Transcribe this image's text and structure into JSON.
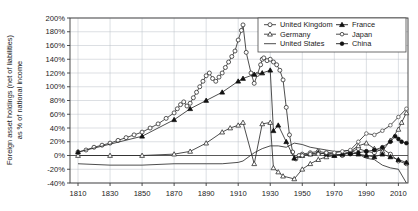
{
  "chart_data": {
    "type": "line",
    "title": "",
    "xlabel": "",
    "ylabel": "Foreign asset holdings (net of liabilities) as % of national income",
    "ylabel_line1": "Foreign asset holdings (net of liabilities)",
    "ylabel_line2": "as % of national income",
    "xlim": [
      1805,
      2016
    ],
    "ylim": [
      -40,
      200
    ],
    "ytick_step": 20,
    "xtick_step": 20,
    "grid": true,
    "legend_position": "top-right",
    "yticks": [
      "200%",
      "180%",
      "160%",
      "140%",
      "120%",
      "100%",
      "80%",
      "60%",
      "40%",
      "20%",
      "0%",
      "-20%",
      "-40%"
    ],
    "ytick_values": [
      200,
      180,
      160,
      140,
      120,
      100,
      80,
      60,
      40,
      20,
      0,
      -20,
      -40
    ],
    "xticks": [
      "1810",
      "1830",
      "1850",
      "1870",
      "1890",
      "1910",
      "1930",
      "1950",
      "1970",
      "1990",
      "2010"
    ],
    "xtick_values": [
      1810,
      1830,
      1850,
      1870,
      1890,
      1910,
      1930,
      1950,
      1970,
      1990,
      2010
    ],
    "series": [
      {
        "name": "United Kingdom",
        "marker": "open-circle",
        "x": [
          1810,
          1815,
          1820,
          1825,
          1830,
          1835,
          1840,
          1845,
          1850,
          1855,
          1860,
          1865,
          1870,
          1872,
          1874,
          1876,
          1878,
          1880,
          1882,
          1884,
          1886,
          1888,
          1890,
          1892,
          1894,
          1896,
          1898,
          1900,
          1902,
          1904,
          1906,
          1908,
          1910,
          1912,
          1913,
          1915,
          1918,
          1920,
          1922,
          1924,
          1925,
          1926,
          1928,
          1930,
          1932,
          1934,
          1936,
          1938,
          1940,
          1942,
          1944,
          1946,
          1948,
          1950,
          1955,
          1960,
          1965,
          1970,
          1975,
          1980,
          1985,
          1990,
          1995,
          2000,
          2005,
          2010,
          2015
        ],
        "y": [
          5,
          8,
          12,
          15,
          18,
          22,
          26,
          30,
          34,
          40,
          46,
          54,
          62,
          68,
          74,
          78,
          72,
          76,
          84,
          92,
          100,
          108,
          116,
          120,
          112,
          108,
          114,
          120,
          128,
          136,
          144,
          152,
          168,
          182,
          190,
          150,
          120,
          105,
          118,
          132,
          140,
          142,
          138,
          140,
          136,
          132,
          124,
          110,
          70,
          30,
          5,
          -5,
          0,
          2,
          4,
          6,
          4,
          2,
          0,
          5,
          10,
          6,
          4,
          10,
          2,
          -8,
          -12
        ],
        "color": "#2e2e2e"
      },
      {
        "name": "Germany",
        "marker": "open-triangle",
        "x": [
          1810,
          1830,
          1850,
          1870,
          1880,
          1890,
          1900,
          1905,
          1910,
          1913,
          1920,
          1925,
          1930,
          1932,
          1935,
          1938,
          1945,
          1950,
          1955,
          1960,
          1965,
          1970,
          1975,
          1980,
          1985,
          1990,
          1995,
          2000,
          2005,
          2010,
          2012,
          2015
        ],
        "y": [
          0,
          0,
          0,
          2,
          6,
          18,
          34,
          40,
          44,
          48,
          -12,
          46,
          48,
          -18,
          -24,
          -30,
          -34,
          -20,
          -12,
          -6,
          -2,
          0,
          2,
          6,
          14,
          18,
          10,
          6,
          22,
          38,
          48,
          62
        ],
        "color": "#2e2e2e"
      },
      {
        "name": "United States",
        "marker": "line",
        "x": [
          1810,
          1830,
          1850,
          1870,
          1890,
          1900,
          1910,
          1913,
          1920,
          1925,
          1930,
          1935,
          1940,
          1945,
          1950,
          1955,
          1960,
          1965,
          1970,
          1975,
          1980,
          1985,
          1990,
          1995,
          2000,
          2005,
          2010,
          2015
        ],
        "y": [
          -12,
          -14,
          -14,
          -12,
          -12,
          -12,
          -10,
          -8,
          4,
          10,
          14,
          14,
          12,
          18,
          16,
          12,
          10,
          8,
          6,
          6,
          8,
          2,
          -4,
          -6,
          -14,
          -18,
          -20,
          -40
        ],
        "color": "#6b6b6b"
      },
      {
        "name": "France",
        "marker": "filled-triangle",
        "x": [
          1810,
          1850,
          1870,
          1880,
          1890,
          1900,
          1910,
          1913,
          1920,
          1925,
          1930,
          1932,
          1935,
          1940,
          1945,
          1950,
          1955,
          1960,
          1965,
          1970,
          1975,
          1980,
          1985,
          1990,
          1995,
          2000,
          2005,
          2010,
          2015
        ],
        "y": [
          5,
          28,
          52,
          68,
          80,
          92,
          108,
          112,
          118,
          120,
          124,
          36,
          44,
          20,
          -4,
          0,
          2,
          4,
          2,
          0,
          2,
          4,
          2,
          0,
          -2,
          2,
          -2,
          -6,
          -10
        ],
        "color": "#111111"
      },
      {
        "name": "Japan",
        "marker": "open-circle-small",
        "x": [
          1950,
          1955,
          1960,
          1965,
          1970,
          1975,
          1980,
          1985,
          1990,
          1995,
          2000,
          2005,
          2010,
          2015
        ],
        "y": [
          0,
          2,
          2,
          4,
          4,
          6,
          8,
          20,
          32,
          30,
          36,
          44,
          56,
          68
        ],
        "color": "#555555"
      },
      {
        "name": "China",
        "marker": "filled-circle",
        "x": [
          1980,
          1985,
          1990,
          1995,
          2000,
          2005,
          2008,
          2010,
          2012,
          2015
        ],
        "y": [
          2,
          4,
          6,
          8,
          12,
          20,
          28,
          24,
          20,
          18
        ],
        "color": "#111111"
      }
    ],
    "legend_entries": [
      {
        "label": "United Kingdom",
        "marker": "open-circle"
      },
      {
        "label": "France",
        "marker": "filled-triangle"
      },
      {
        "label": "Germany",
        "marker": "open-triangle"
      },
      {
        "label": "Japan",
        "marker": "open-circle-small"
      },
      {
        "label": "United States",
        "marker": "line"
      },
      {
        "label": "China",
        "marker": "filled-circle"
      }
    ]
  }
}
